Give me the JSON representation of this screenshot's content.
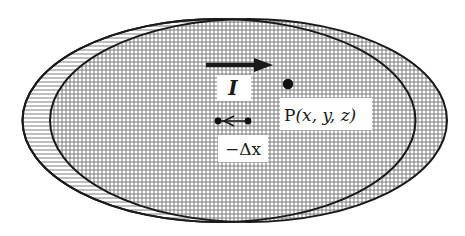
{
  "diagram": {
    "colors": {
      "outline": "#1a1a1a",
      "hatch": "#6e6e6e",
      "background": "#ffffff",
      "label_bg": "#ffffff"
    },
    "grid_spacing_px": 4,
    "shapes": {
      "original_ellipse": {
        "fill_pattern": "horizontal-lines",
        "cx": 219,
        "cy": 120.5,
        "rx": 196.5,
        "ry": 101.5
      },
      "shifted_ellipse": {
        "fill_pattern": "crosshatch",
        "cx": 248.5,
        "cy": 120.5,
        "rx": 198.5,
        "ry": 101.5
      }
    },
    "labels": {
      "current": "I",
      "point": "P(x, y, z)",
      "point_prefix": "P",
      "point_coords": "(x, y, z)",
      "displacement": "−Δx"
    },
    "arrows": {
      "current_direction": "right",
      "displacement_direction": "left"
    }
  }
}
